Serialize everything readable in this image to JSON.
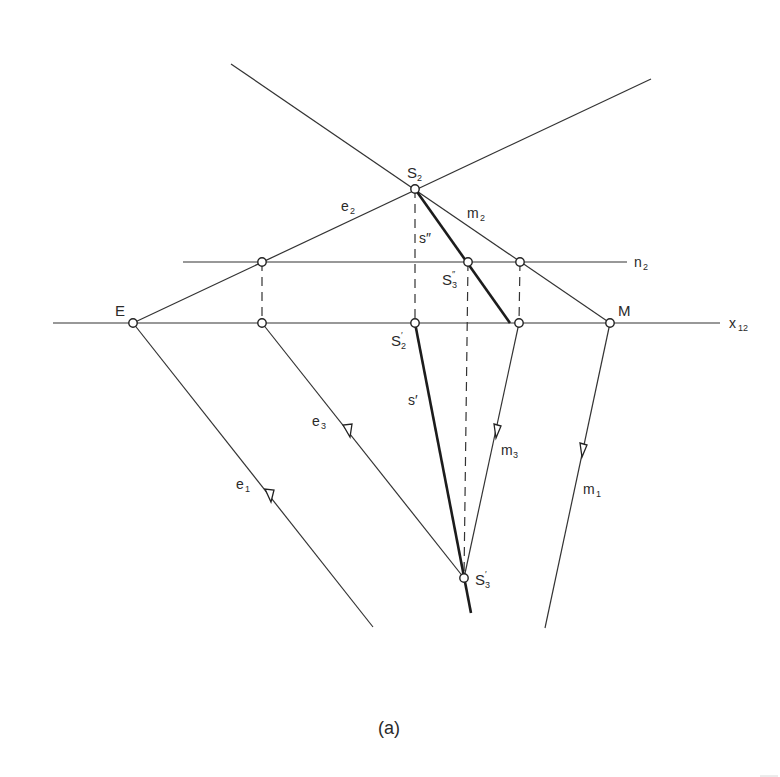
{
  "figure": {
    "caption": "(a)",
    "labels": {
      "E": "E",
      "M": "M",
      "x12_main": "x",
      "x12_sub": "12",
      "n2_main": "n",
      "n2_sub": "2",
      "S2_main": "S",
      "S2_sub": "2",
      "e2_main": "e",
      "e2_sub": "2",
      "m2_main": "m",
      "m2_sub": "2",
      "s_double_prime": "s″",
      "S3dp_main": "S",
      "S3dp_sup": "″",
      "S3dp_sub": "3",
      "S2p_main": "S",
      "S2p_sup": "′",
      "S2p_sub": "2",
      "s_prime": "s′",
      "e3_main": "e",
      "e3_sub": "3",
      "e1_main": "e",
      "e1_sub": "1",
      "m3_main": "m",
      "m3_sub": "3",
      "m1_main": "m",
      "m1_sub": "1",
      "S3p_main": "S",
      "S3p_sup": "′",
      "S3p_sub": "3"
    },
    "colors": {
      "background": "#ffffff",
      "line": "#333333",
      "bold_line": "#1c1c1c"
    }
  }
}
